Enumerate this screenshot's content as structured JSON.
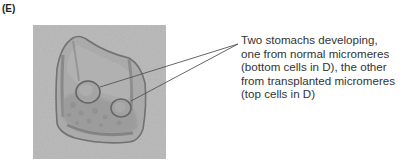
{
  "figure": {
    "panel_label": "(E)",
    "photo": {
      "subject": "micrograph of sea urchin embryo with two developing stomachs",
      "background_color": "#b6b6b6",
      "embryo_fill": "#a9a9a9",
      "outline_color": "#6e6e6e"
    },
    "annotation": {
      "lines": [
        "Two stomachs developing,",
        "one from normal micromeres",
        "(bottom cells in D), the other",
        "from transplanted micromeres",
        "(top cells in D)"
      ],
      "text": "Two stomachs developing,\none from normal micromeres\n(bottom cells in D), the other\nfrom transplanted micromeres\n(top cells in D)",
      "text_color": "#333333",
      "leader_color": "#555555"
    }
  }
}
